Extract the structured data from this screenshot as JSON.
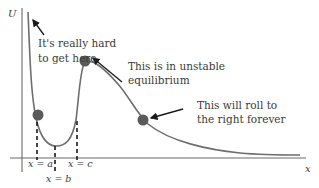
{
  "diagram": {
    "axes": {
      "y_label": "U",
      "x_label": "x"
    },
    "annotations": [
      {
        "id": "hard",
        "lines": [
          "It's really hard",
          "to get here"
        ]
      },
      {
        "id": "unstable",
        "lines": [
          "This is in unstable",
          "equilibrium"
        ]
      },
      {
        "id": "roll",
        "lines": [
          "This will roll to",
          "the right forever"
        ]
      }
    ],
    "markers": [
      {
        "id": "a",
        "label": "x = a"
      },
      {
        "id": "b",
        "label": "x = b"
      },
      {
        "id": "c",
        "label": "x = c"
      }
    ],
    "colors": {
      "curve": "#6e6e6e",
      "ball": "#5a5a5a",
      "axis": "#6a6a6a",
      "text": "#3a3a3a"
    }
  }
}
